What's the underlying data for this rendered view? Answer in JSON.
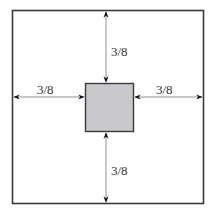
{
  "diagram": {
    "title": "",
    "outer_square": {
      "stroke": "#3a3a3a",
      "fill": "#ffffff"
    },
    "inner_square": {
      "stroke": "#3a3a3a",
      "fill": "#c9c9cd"
    },
    "dimensions": {
      "top": "3/8",
      "left": "3/8",
      "right": "3/8",
      "bottom": "3/8"
    }
  }
}
